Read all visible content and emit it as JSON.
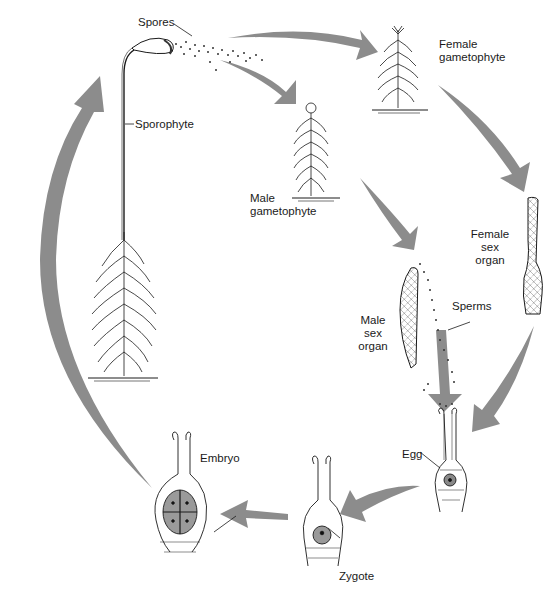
{
  "diagram": {
    "arrow_color": "#8c8c8c",
    "line_color": "#1a1a1a",
    "labels": {
      "spores": "Spores",
      "sporophyte": "Sporophyte",
      "female_gametophyte_1": "Female",
      "female_gametophyte_2": "gametophyte",
      "male_gametophyte_1": "Male",
      "male_gametophyte_2": "gametophyte",
      "female_sex_organ_1": "Female",
      "female_sex_organ_2": "sex",
      "female_sex_organ_3": "organ",
      "male_sex_organ_1": "Male",
      "male_sex_organ_2": "sex",
      "male_sex_organ_3": "organ",
      "sperms": "Sperms",
      "egg": "Egg",
      "zygote": "Zygote",
      "embryo": "Embryo"
    },
    "stages": [
      "Sporophyte",
      "Spores",
      "Female gametophyte",
      "Male gametophyte",
      "Female sex organ",
      "Male sex organ",
      "Sperms",
      "Egg",
      "Zygote",
      "Embryo"
    ]
  }
}
